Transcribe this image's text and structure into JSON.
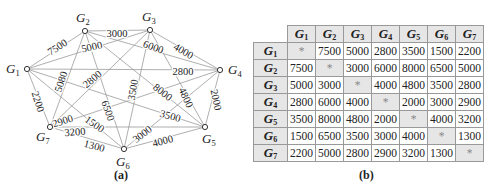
{
  "graph": {
    "caption": "(a)",
    "nodes": [
      {
        "id": "G1",
        "label": "G",
        "sub": "1",
        "x": 27,
        "y": 69,
        "lx": 6,
        "ly": 73
      },
      {
        "id": "G2",
        "label": "G",
        "sub": "2",
        "x": 85,
        "y": 31,
        "lx": 76,
        "ly": 22
      },
      {
        "id": "G3",
        "label": "G",
        "sub": "3",
        "x": 150,
        "y": 30,
        "lx": 142,
        "ly": 21
      },
      {
        "id": "G4",
        "label": "G",
        "sub": "4",
        "x": 220,
        "y": 70,
        "lx": 228,
        "ly": 74
      },
      {
        "id": "G5",
        "label": "G",
        "sub": "5",
        "x": 205,
        "y": 127,
        "lx": 202,
        "ly": 143
      },
      {
        "id": "G6",
        "label": "G",
        "sub": "6",
        "x": 124,
        "y": 149,
        "lx": 116,
        "ly": 166
      },
      {
        "id": "G7",
        "label": "G",
        "sub": "7",
        "x": 50,
        "y": 127,
        "lx": 36,
        "ly": 141
      }
    ],
    "edges": [
      {
        "from": "G1",
        "to": "G2",
        "weight": "7500",
        "lx": 58,
        "ly": 48,
        "rot": -33
      },
      {
        "from": "G2",
        "to": "G3",
        "weight": "3000",
        "lx": 117,
        "ly": 35,
        "rot": 0
      },
      {
        "from": "G3",
        "to": "G4",
        "weight": "4000",
        "lx": 183,
        "ly": 52,
        "rot": 30
      },
      {
        "from": "G1",
        "to": "G4",
        "weight": "2800",
        "lx": 183,
        "ly": 73,
        "rot": 0
      },
      {
        "from": "G4",
        "to": "G5",
        "weight": "2000",
        "lx": 215,
        "ly": 100,
        "rot": 78
      },
      {
        "from": "G5",
        "to": "G6",
        "weight": "4000",
        "lx": 163,
        "ly": 142,
        "rot": -15
      },
      {
        "from": "G6",
        "to": "G7",
        "weight": "1300",
        "lx": 94,
        "ly": 147,
        "rot": 15
      },
      {
        "from": "G7",
        "to": "G1",
        "weight": "2200",
        "lx": 37,
        "ly": 102,
        "rot": 72
      },
      {
        "from": "G2",
        "to": "G4",
        "weight": "6000",
        "lx": 153,
        "ly": 48,
        "rot": 20
      },
      {
        "from": "G3",
        "to": "G1",
        "weight": "5000",
        "lx": 92,
        "ly": 48,
        "rot": -12
      },
      {
        "from": "G2",
        "to": "G7",
        "weight": "5080",
        "lx": 62,
        "ly": 82,
        "rot": -72
      },
      {
        "from": "G3",
        "to": "G7",
        "weight": "2800",
        "lx": 93,
        "ly": 80,
        "rot": -40
      },
      {
        "from": "G2",
        "to": "G5",
        "weight": "8000",
        "lx": 162,
        "ly": 93,
        "rot": 38
      },
      {
        "from": "G3",
        "to": "G5",
        "weight": "4800",
        "lx": 185,
        "ly": 98,
        "rot": 65
      },
      {
        "from": "G3",
        "to": "G6",
        "weight": "3500",
        "lx": 134,
        "ly": 90,
        "rot": -80
      },
      {
        "from": "G2",
        "to": "G6",
        "weight": "6500",
        "lx": 107,
        "ly": 111,
        "rot": 70
      },
      {
        "from": "G1",
        "to": "G5",
        "weight": "3500",
        "lx": 170,
        "ly": 117,
        "rot": 15
      },
      {
        "from": "G4",
        "to": "G6",
        "weight": "3000",
        "lx": 143,
        "ly": 135,
        "rot": -38
      },
      {
        "from": "G4",
        "to": "G7",
        "weight": "2900",
        "lx": 63,
        "ly": 122,
        "rot": -18
      },
      {
        "from": "G1",
        "to": "G6",
        "weight": "1500",
        "lx": 94,
        "ly": 125,
        "rot": 35
      },
      {
        "from": "G7",
        "to": "G5",
        "weight": "3200",
        "lx": 75,
        "ly": 133,
        "rot": -5
      }
    ]
  },
  "table": {
    "caption": "(b)",
    "headers": [
      "G1",
      "G2",
      "G3",
      "G4",
      "G5",
      "G6",
      "G7"
    ],
    "rows": [
      {
        "label": "G1",
        "cells": [
          "*",
          "7500",
          "5000",
          "2800",
          "3500",
          "1500",
          "2200"
        ]
      },
      {
        "label": "G2",
        "cells": [
          "7500",
          "*",
          "3000",
          "6000",
          "8000",
          "6500",
          "5000"
        ]
      },
      {
        "label": "G3",
        "cells": [
          "5000",
          "3000",
          "*",
          "4000",
          "4800",
          "3500",
          "2800"
        ]
      },
      {
        "label": "G4",
        "cells": [
          "2800",
          "6000",
          "4000",
          "*",
          "2000",
          "3000",
          "2900"
        ]
      },
      {
        "label": "G5",
        "cells": [
          "3500",
          "8000",
          "4800",
          "2000",
          "*",
          "4000",
          "3200"
        ]
      },
      {
        "label": "G6",
        "cells": [
          "1500",
          "6500",
          "3500",
          "3000",
          "4000",
          "*",
          "1300"
        ]
      },
      {
        "label": "G7",
        "cells": [
          "2200",
          "5000",
          "2800",
          "2900",
          "3200",
          "1300",
          "*"
        ]
      }
    ]
  },
  "colors": {
    "edge": "#9a9a9a",
    "node_fill": "#ffffff",
    "node_stroke": "#333333",
    "text": "#222222",
    "header_bg": "#e6e6e6",
    "diag_bg": "#e6e6e6",
    "table_border": "#999999"
  }
}
